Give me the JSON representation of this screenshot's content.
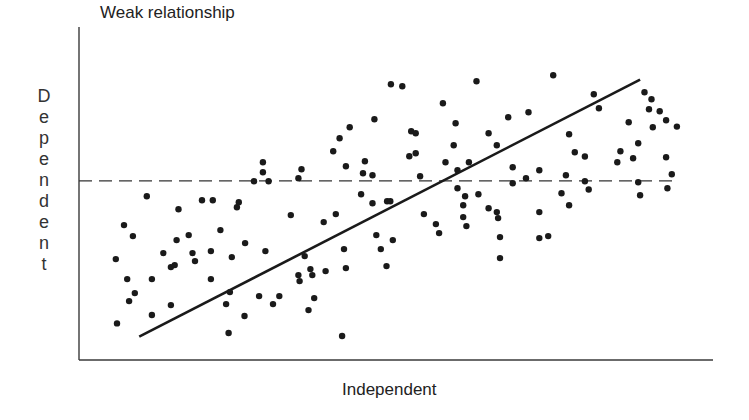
{
  "chart_data": {
    "type": "scatter",
    "title": "Weak relationship",
    "xlabel": "Independent",
    "ylabel": "Dependent",
    "xlim": [
      0,
      100
    ],
    "ylim": [
      0,
      100
    ],
    "grid": false,
    "legend": null,
    "annotations": [
      {
        "type": "regression-line",
        "style": "solid",
        "from": [
          9.5,
          7.0
        ],
        "to": [
          88.5,
          84.2
        ]
      },
      {
        "type": "mean-line",
        "style": "dashed",
        "y": 53.8,
        "x_from": 0,
        "x_to": 94.3
      }
    ],
    "points": [
      [
        5.8,
        30.3
      ],
      [
        6.0,
        11.0
      ],
      [
        7.1,
        40.5
      ],
      [
        7.6,
        24.3
      ],
      [
        7.9,
        17.7
      ],
      [
        8.5,
        37.2
      ],
      [
        8.8,
        20.1
      ],
      [
        10.7,
        49.2
      ],
      [
        11.5,
        24.3
      ],
      [
        11.5,
        13.5
      ],
      [
        13.3,
        32.1
      ],
      [
        14.5,
        27.9
      ],
      [
        14.5,
        16.5
      ],
      [
        15.1,
        28.5
      ],
      [
        15.4,
        36.0
      ],
      [
        15.7,
        45.3
      ],
      [
        17.3,
        37.5
      ],
      [
        17.9,
        32.1
      ],
      [
        18.3,
        29.7
      ],
      [
        19.4,
        48.0
      ],
      [
        20.8,
        24.3
      ],
      [
        20.8,
        32.7
      ],
      [
        21.1,
        48.0
      ],
      [
        22.3,
        39.0
      ],
      [
        23.2,
        16.8
      ],
      [
        23.6,
        8.1
      ],
      [
        23.8,
        20.4
      ],
      [
        24.1,
        30.9
      ],
      [
        24.9,
        45.9
      ],
      [
        25.2,
        47.4
      ],
      [
        26.1,
        13.2
      ],
      [
        26.2,
        35.1
      ],
      [
        27.6,
        53.7
      ],
      [
        28.4,
        19.2
      ],
      [
        29.0,
        59.4
      ],
      [
        29.0,
        56.4
      ],
      [
        29.4,
        32.7
      ],
      [
        29.9,
        53.7
      ],
      [
        30.6,
        16.8
      ],
      [
        31.6,
        19.2
      ],
      [
        33.4,
        43.5
      ],
      [
        34.6,
        54.6
      ],
      [
        34.6,
        25.5
      ],
      [
        34.8,
        23.7
      ],
      [
        35.1,
        57.3
      ],
      [
        35.6,
        31.2
      ],
      [
        36.2,
        15.0
      ],
      [
        36.5,
        27.3
      ],
      [
        36.8,
        25.5
      ],
      [
        37.1,
        18.6
      ],
      [
        38.6,
        41.4
      ],
      [
        38.9,
        26.7
      ],
      [
        40.1,
        62.7
      ],
      [
        40.5,
        43.8
      ],
      [
        41.1,
        66.6
      ],
      [
        41.5,
        7.2
      ],
      [
        41.8,
        33.3
      ],
      [
        42.1,
        27.6
      ],
      [
        42.1,
        58.2
      ],
      [
        42.7,
        69.9
      ],
      [
        44.5,
        49.8
      ],
      [
        44.8,
        56.1
      ],
      [
        45.1,
        59.7
      ],
      [
        46.3,
        55.5
      ],
      [
        46.3,
        47.1
      ],
      [
        46.6,
        72.3
      ],
      [
        46.9,
        37.5
      ],
      [
        47.6,
        33.3
      ],
      [
        48.5,
        28.2
      ],
      [
        48.6,
        47.7
      ],
      [
        49.1,
        47.7
      ],
      [
        49.2,
        82.8
      ],
      [
        49.5,
        36.0
      ],
      [
        51.0,
        82.2
      ],
      [
        52.1,
        61.2
      ],
      [
        52.4,
        68.7
      ],
      [
        53.1,
        68.1
      ],
      [
        53.1,
        62.1
      ],
      [
        53.8,
        55.2
      ],
      [
        54.4,
        43.8
      ],
      [
        56.3,
        40.8
      ],
      [
        56.8,
        38.1
      ],
      [
        57.4,
        77.1
      ],
      [
        57.8,
        59.4
      ],
      [
        59.1,
        64.5
      ],
      [
        59.4,
        71.1
      ],
      [
        59.7,
        57.0
      ],
      [
        59.7,
        51.6
      ],
      [
        60.6,
        46.5
      ],
      [
        60.6,
        42.9
      ],
      [
        60.9,
        49.2
      ],
      [
        61.1,
        40.2
      ],
      [
        61.5,
        59.4
      ],
      [
        62.7,
        83.7
      ],
      [
        63.0,
        49.8
      ],
      [
        64.6,
        68.1
      ],
      [
        64.6,
        45.6
      ],
      [
        65.9,
        64.5
      ],
      [
        65.9,
        44.4
      ],
      [
        66.1,
        42.6
      ],
      [
        66.4,
        36.9
      ],
      [
        66.4,
        30.6
      ],
      [
        67.7,
        72.9
      ],
      [
        68.4,
        57.9
      ],
      [
        68.4,
        53.1
      ],
      [
        70.5,
        54.6
      ],
      [
        70.9,
        74.4
      ],
      [
        72.6,
        57.0
      ],
      [
        72.6,
        44.4
      ],
      [
        72.6,
        36.6
      ],
      [
        74.0,
        37.2
      ],
      [
        74.8,
        85.5
      ],
      [
        76.1,
        50.1
      ],
      [
        76.8,
        55.5
      ],
      [
        77.3,
        67.8
      ],
      [
        77.3,
        46.5
      ],
      [
        78.2,
        62.4
      ],
      [
        79.8,
        61.1
      ],
      [
        79.8,
        53.7
      ],
      [
        80.4,
        51.2
      ],
      [
        81.2,
        79.8
      ],
      [
        82.0,
        75.6
      ],
      [
        84.9,
        59.4
      ],
      [
        85.4,
        62.7
      ],
      [
        86.7,
        71.4
      ],
      [
        87.4,
        60.6
      ],
      [
        88.2,
        65.1
      ],
      [
        88.2,
        53.4
      ],
      [
        88.5,
        49.5
      ],
      [
        89.2,
        80.4
      ],
      [
        89.9,
        75.3
      ],
      [
        90.3,
        78.3
      ],
      [
        90.5,
        69.9
      ],
      [
        91.6,
        74.7
      ],
      [
        92.6,
        72.0
      ],
      [
        92.6,
        60.9
      ],
      [
        92.8,
        51.6
      ],
      [
        93.5,
        55.8
      ],
      [
        94.3,
        70.1
      ]
    ]
  },
  "labels": {
    "title": "Weak relationship",
    "xlabel": "Independent",
    "ylabel_letters": [
      "D",
      "e",
      "p",
      "e",
      "n",
      "d",
      "e",
      "n",
      "t"
    ]
  },
  "colors": {
    "ink": "#1a1a1a",
    "axis": "#3a3a3a",
    "background": "#ffffff"
  }
}
